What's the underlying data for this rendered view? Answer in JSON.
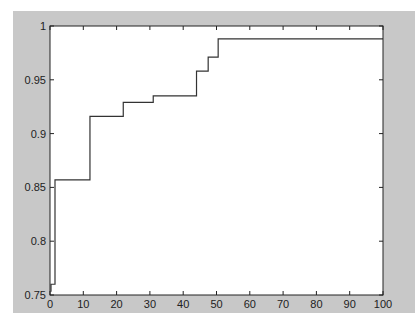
{
  "chart_data": {
    "type": "line",
    "title": "",
    "xlabel": "",
    "ylabel": "",
    "xlim": [
      0,
      100
    ],
    "ylim": [
      0.75,
      1
    ],
    "grid": false,
    "legend": null,
    "x_ticks": [
      "0",
      "10",
      "20",
      "30",
      "40",
      "50",
      "60",
      "70",
      "80",
      "90",
      "100"
    ],
    "y_ticks": [
      "0.75",
      "0.8",
      "0.85",
      "0.9",
      "0.95",
      "1"
    ],
    "series": [
      {
        "name": "step curve",
        "style": "stairs",
        "color": "#333333",
        "x": [
          0.3,
          1.5,
          12,
          22,
          31,
          44,
          47.5,
          50.5,
          100
        ],
        "y": [
          0.76,
          0.857,
          0.916,
          0.929,
          0.935,
          0.958,
          0.971,
          0.988,
          0.988
        ]
      }
    ]
  },
  "colors": {
    "figure_background": "#c8c8c8",
    "axes_background": "#ffffff",
    "axis_line": "#222222",
    "line": "#333333"
  }
}
